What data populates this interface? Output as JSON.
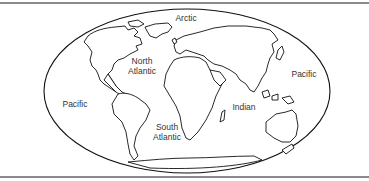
{
  "map": {
    "projection": "oval world outline map",
    "border_color": "#8a8a8a",
    "outline_color": "#111111",
    "oceans": [
      {
        "id": "arctic",
        "lines": [
          "Arctic"
        ],
        "x": 186,
        "y": 13
      },
      {
        "id": "north-atlantic",
        "lines": [
          "North",
          "Atlantic"
        ],
        "x": 142,
        "y": 56
      },
      {
        "id": "pacific-east",
        "lines": [
          "Pacific"
        ],
        "x": 304,
        "y": 69
      },
      {
        "id": "pacific-west",
        "lines": [
          "Pacific"
        ],
        "x": 75,
        "y": 99
      },
      {
        "id": "indian",
        "lines": [
          "Indian"
        ],
        "x": 244,
        "y": 102
      },
      {
        "id": "south-atlantic",
        "lines": [
          "South",
          "Atlantic"
        ],
        "x": 167,
        "y": 122
      }
    ]
  }
}
